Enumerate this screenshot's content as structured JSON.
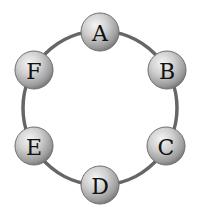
{
  "diagram": {
    "type": "ring",
    "ring": {
      "cx": 100,
      "cy": 108,
      "r": 77,
      "stroke": "#666666",
      "stroke_width": 3.5
    },
    "node_radius": 19,
    "nodes": [
      {
        "label": "A",
        "x": 100,
        "y": 32
      },
      {
        "label": "B",
        "x": 167,
        "y": 70
      },
      {
        "label": "C",
        "x": 166,
        "y": 146
      },
      {
        "label": "D",
        "x": 100,
        "y": 185
      },
      {
        "label": "E",
        "x": 34,
        "y": 146
      },
      {
        "label": "F",
        "x": 34,
        "y": 70
      }
    ],
    "edges": [
      [
        "A",
        "B"
      ],
      [
        "B",
        "C"
      ],
      [
        "C",
        "D"
      ],
      [
        "D",
        "E"
      ],
      [
        "E",
        "F"
      ],
      [
        "F",
        "A"
      ]
    ]
  }
}
